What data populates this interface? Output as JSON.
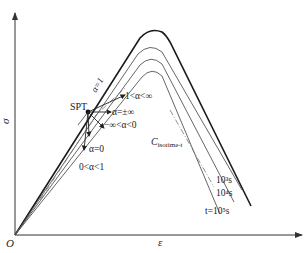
{
  "diagram": {
    "type": "stress-strain schematic",
    "axes": {
      "y_label": "σ",
      "x_label": "ε",
      "origin_label": "O"
    },
    "point_label": "SPT",
    "curve_label": "C",
    "curve_label_sub": "isotime-t",
    "alpha_main_label": "α=1",
    "alpha_labels": {
      "gt1": "1<α<∞",
      "pm_inf": "α=±∞",
      "neg": "−∞<α<0",
      "zero": "α=0",
      "between": "0<α<1"
    },
    "time_labels": {
      "t3": "10³s",
      "t4": "10⁴s",
      "t5": "t=10⁵s"
    },
    "colors": {
      "outer_curve": "#1a1a1a",
      "isotime_curves": "#555555",
      "axes": "#333333"
    }
  }
}
